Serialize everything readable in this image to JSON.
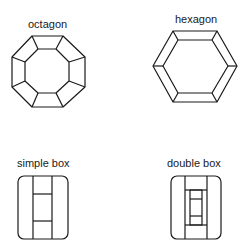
{
  "figure": {
    "shapes": [
      {
        "id": "octagon",
        "label": "octagon"
      },
      {
        "id": "hexagon",
        "label": "hexagon"
      },
      {
        "id": "simple-box",
        "label": "simple box"
      },
      {
        "id": "double-box",
        "label": "double box"
      }
    ]
  },
  "colors": {
    "stroke": "#1a1a1a",
    "background": "#ffffff"
  }
}
